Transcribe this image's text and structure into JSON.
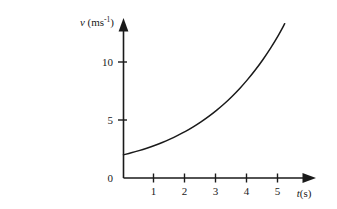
{
  "figure": {
    "part_label": "(c)",
    "background_color": "#ffffff",
    "line_color": "#1a1a1a"
  },
  "chart_data": {
    "type": "line",
    "title": "",
    "subtitle": "",
    "xlabel": "t(s)",
    "xlabel_symbol": "t",
    "xlabel_unit": "(s)",
    "ylabel": "v (ms-1)",
    "ylabel_symbol": "v",
    "ylabel_unit_base": " (ms",
    "ylabel_unit_exp": "-1",
    "ylabel_unit_close": ")",
    "xticks": [
      1,
      2,
      3,
      4,
      5
    ],
    "xtick_labels": [
      "1",
      "2",
      "3",
      "4",
      "5"
    ],
    "yticks": [
      0,
      5,
      10
    ],
    "ytick_labels": [
      "0",
      "5",
      "10"
    ],
    "xlim": [
      0,
      5.9
    ],
    "ylim": [
      0,
      13.5
    ],
    "grid": false,
    "legend": null,
    "annotations": [],
    "series": [
      {
        "name": "velocity",
        "description": "smooth increasing curve, concave up, starting at v = 2 at t = 0 and rising to v = 12 at t = 5.2",
        "x": [
          0,
          0.25,
          0.5,
          0.75,
          1,
          1.25,
          1.5,
          1.75,
          2,
          2.25,
          2.5,
          2.75,
          3,
          3.25,
          3.5,
          3.75,
          4,
          4.25,
          4.5,
          4.75,
          5,
          5.2
        ],
        "y": [
          2.0,
          2.17,
          2.36,
          2.57,
          2.8,
          3.06,
          3.35,
          3.67,
          4.02,
          4.41,
          4.84,
          5.31,
          5.83,
          6.4,
          7.03,
          7.72,
          8.48,
          9.31,
          10.22,
          11.22,
          12.32,
          13.3
        ]
      }
    ]
  }
}
